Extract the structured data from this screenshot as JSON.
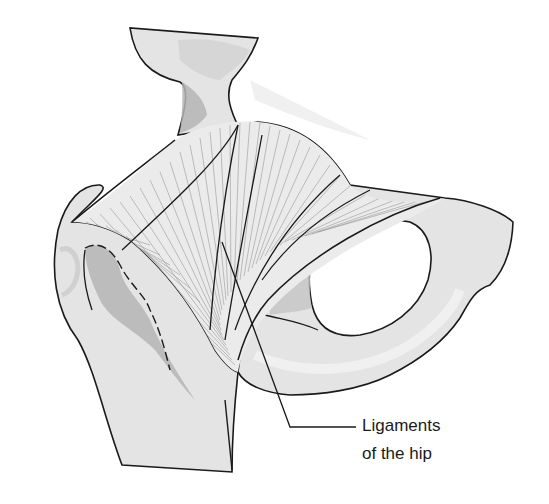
{
  "figure": {
    "callout": {
      "line1": "Ligaments",
      "line2": "of the hip"
    },
    "colors": {
      "background": "#ffffff",
      "bone_fill": "#e4e4e4",
      "bone_light": "#eeeeee",
      "bone_shadow": "#b5b5b5",
      "outline": "#1a1a1a",
      "ligament_fiber": "#8a8a8a"
    }
  }
}
